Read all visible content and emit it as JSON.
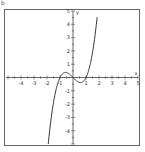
{
  "figure": {
    "corner_label": "b"
  },
  "chart_data": {
    "type": "line",
    "title": "",
    "function": "y = x^3 - x",
    "xlabel": "x",
    "ylabel": "y",
    "xlim": [
      -5,
      5
    ],
    "ylim": [
      -5,
      5
    ],
    "grid": false,
    "legend": "none",
    "x_ticks": [
      -4,
      -3,
      -2,
      -1,
      1,
      2,
      3,
      4,
      5
    ],
    "y_ticks": [
      5,
      4,
      3,
      2,
      1,
      -1,
      -2,
      -3,
      -4
    ],
    "x_tick_labels": [
      "-4",
      "-3",
      "-2",
      "-1",
      "1",
      "2",
      "3",
      "4",
      "5"
    ],
    "y_tick_labels": [
      "5",
      "4",
      "3",
      "2",
      "1",
      "-1",
      "-2",
      "-3",
      "-4"
    ],
    "series": [
      {
        "name": "f(x)",
        "x": [
          -1.9,
          -1.75,
          -1.5,
          -1.25,
          -1.0,
          -0.75,
          -0.577,
          -0.4,
          -0.2,
          0.0,
          0.2,
          0.4,
          0.577,
          0.75,
          1.0,
          1.25,
          1.5,
          1.75,
          1.85
        ],
        "values": [
          -4.96,
          -3.61,
          -1.88,
          -0.7,
          0.0,
          0.33,
          0.385,
          0.34,
          0.19,
          0.0,
          -0.19,
          -0.34,
          -0.385,
          -0.33,
          0.0,
          0.7,
          1.88,
          3.61,
          4.48
        ]
      }
    ],
    "annotations": [
      "x",
      "y"
    ],
    "colors": {
      "curve": "#333333",
      "axes": "#444444",
      "frame": "#555555"
    }
  }
}
